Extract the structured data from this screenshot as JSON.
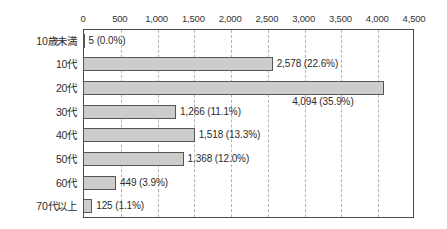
{
  "chart_data": {
    "type": "bar",
    "orientation": "horizontal",
    "title": "",
    "xlabel": "",
    "ylabel": "",
    "xlim": [
      0,
      4500
    ],
    "grid": true,
    "legend": false,
    "categories": [
      "10歳未満",
      "10代",
      "20代",
      "30代",
      "40代",
      "50代",
      "60代",
      "70代以上"
    ],
    "values": [
      5,
      2578,
      4094,
      1266,
      1518,
      1368,
      449,
      125
    ],
    "percentages": [
      "0.0%",
      "22.6%",
      "35.9%",
      "11.1%",
      "13.3%",
      "12.0%",
      "3.9%",
      "1.1%"
    ],
    "data_labels": [
      "5 (0.0%)",
      "2,578 (22.6%)",
      "4,094 (35.9%)",
      "1,266 (11.1%)",
      "1,518 (13.3%)",
      "1,368 (12.0%)",
      "449 (3.9%)",
      "125 (1.1%)"
    ],
    "label_placement": [
      "outside",
      "outside",
      "below",
      "outside",
      "outside",
      "outside",
      "outside",
      "outside"
    ],
    "xticks": [
      0,
      500,
      1000,
      1500,
      2000,
      2500,
      3000,
      3500,
      4000,
      4500
    ],
    "xtick_labels": [
      "0",
      "500",
      "1,000",
      "1,500",
      "2,000",
      "2,500",
      "3,000",
      "3,500",
      "4,000",
      "4,500"
    ],
    "colors": {
      "bar_fill": "#cccccc",
      "bar_stroke": "#555555",
      "grid": "#b4b4b4",
      "axis": "#4a4a4a",
      "text": "#2b2b2b",
      "background": "#ffffff"
    }
  }
}
